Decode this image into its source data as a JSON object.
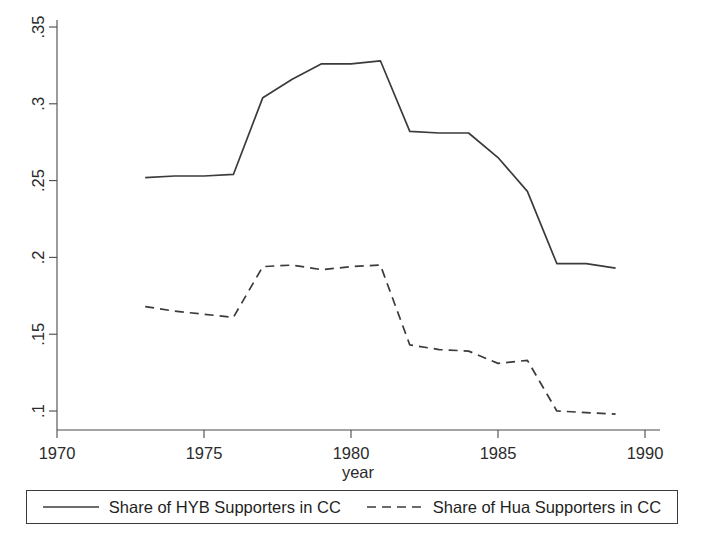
{
  "chart_data": {
    "type": "line",
    "title": "",
    "xlabel": "year",
    "ylabel": "",
    "xlim": [
      1970,
      1990
    ],
    "ylim": [
      0.1,
      0.35
    ],
    "grid": false,
    "legend_position": "bottom",
    "x": [
      1973,
      1974,
      1975,
      1976,
      1977,
      1978,
      1979,
      1980,
      1981,
      1982,
      1983,
      1984,
      1985,
      1986,
      1987,
      1988,
      1989
    ],
    "xticks": [
      "1970",
      "1975",
      "1980",
      "1985",
      "1990"
    ],
    "xtick_values": [
      1970,
      1975,
      1980,
      1985,
      1990
    ],
    "yticks": [
      ".1",
      ".15",
      ".2",
      ".25",
      ".3",
      ".35"
    ],
    "ytick_values": [
      0.1,
      0.15,
      0.2,
      0.25,
      0.3,
      0.35
    ],
    "series": [
      {
        "name": "Share of HYB Supporters in CC",
        "style": "solid",
        "color": "#3b3b3b",
        "values": [
          0.252,
          0.253,
          0.253,
          0.254,
          0.304,
          0.316,
          0.326,
          0.326,
          0.328,
          0.282,
          0.281,
          0.281,
          0.265,
          0.243,
          0.196,
          0.196,
          0.193
        ]
      },
      {
        "name": "Share of Hua Supporters in CC",
        "style": "dashed",
        "color": "#3b3b3b",
        "values": [
          0.168,
          0.165,
          0.163,
          0.161,
          0.194,
          0.195,
          0.192,
          0.194,
          0.195,
          0.143,
          0.14,
          0.139,
          0.131,
          0.133,
          0.1,
          0.099,
          0.098
        ]
      }
    ]
  },
  "legend": {
    "entries": [
      {
        "label": "Share of HYB Supporters in CC",
        "style": "solid"
      },
      {
        "label": "Share of Hua Supporters in CC",
        "style": "dashed"
      }
    ]
  }
}
